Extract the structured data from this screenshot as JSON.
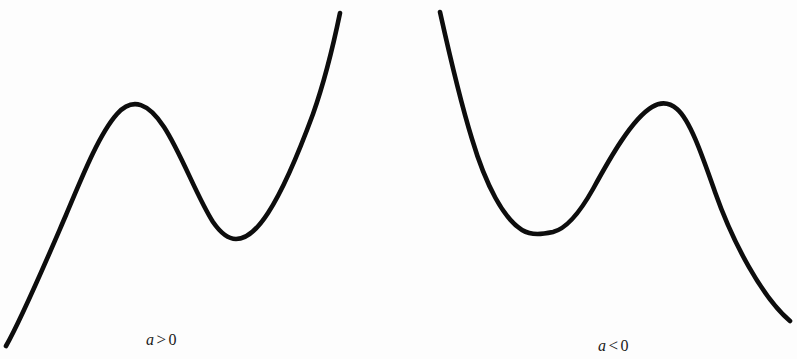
{
  "figure": {
    "background_color": "#fdfdfd",
    "stroke_color": "#0d0d0d",
    "stroke_width": 4.6,
    "width": 797,
    "height": 359
  },
  "panels": [
    {
      "id": "left",
      "caption": {
        "variable": "a",
        "relation": ">",
        "value": "0",
        "full_text": "a > 0"
      }
    },
    {
      "id": "right",
      "caption": {
        "variable": "a",
        "relation": "<",
        "value": "0",
        "full_text": "a < 0"
      }
    }
  ],
  "chart_data": {
    "type": "line",
    "title": "",
    "subtitle": "",
    "xlabel": "",
    "ylabel": "",
    "grid": false,
    "axes_visible": false,
    "legend": "none",
    "note": "Two cubic polynomial curves illustrating the shape of y = ax^3 + ... for positive and negative leading coefficient a. Coordinates are in pixel space of the 797x359 image, y increasing downward.",
    "series": [
      {
        "name": "a > 0",
        "description": "Increasing cubic with a local maximum then a local minimum; rises from lower-left to upper-right.",
        "leading_coefficient_sign": "positive",
        "end_behavior": {
          "left": "down",
          "right": "up"
        },
        "critical_points": [
          {
            "kind": "local-maximum",
            "x": 117,
            "y": 113
          },
          {
            "kind": "local-minimum",
            "x": 233,
            "y": 238
          }
        ],
        "endpoints": [
          {
            "kind": "start",
            "x": 6,
            "y": 346
          },
          {
            "kind": "end",
            "x": 340,
            "y": 13
          }
        ],
        "path": "M 6,346 C 22,318 44,266 66,215 C 84,172 100,133 117,114 C 133,96 149,104 164,127 C 181,153 197,197 213,222 C 222,235 229,239 236,239 C 246,239 257,230 268,213 C 283,190 299,152 313,114 C 325,80 334,42 340,13"
      },
      {
        "name": "a < 0",
        "description": "Decreasing cubic with a local minimum then a local maximum; falls from upper-left to lower-right.",
        "leading_coefficient_sign": "negative",
        "end_behavior": {
          "left": "up",
          "right": "down"
        },
        "critical_points": [
          {
            "kind": "local-minimum",
            "x": 553,
            "y": 232
          },
          {
            "kind": "local-maximum",
            "x": 673,
            "y": 104
          }
        ],
        "endpoints": [
          {
            "kind": "start",
            "x": 440,
            "y": 12
          },
          {
            "kind": "end",
            "x": 790,
            "y": 321
          }
        ],
        "path": "M 440,12 C 448,48 459,97 472,139 C 486,186 504,219 522,230 C 532,236 543,234 553,232 C 565,229 579,214 593,189 C 610,158 632,119 652,107 C 662,101 670,103 677,109 C 690,120 702,155 715,192 C 733,243 762,297 790,321"
      }
    ]
  }
}
